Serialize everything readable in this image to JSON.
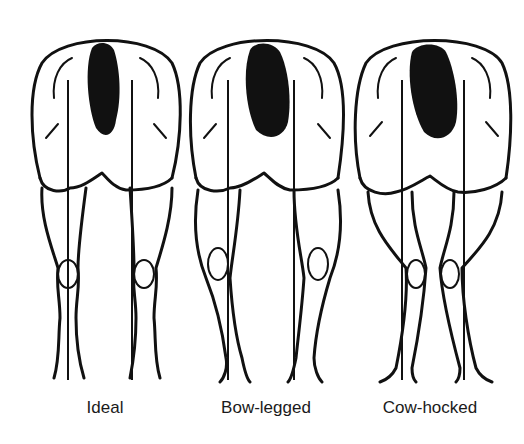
{
  "diagram": {
    "type": "hind-leg-conformation-comparison",
    "panels": [
      {
        "id": "ideal",
        "label": "Ideal",
        "center_x": 105
      },
      {
        "id": "bow-legged",
        "label": "Bow-legged",
        "center_x": 266
      },
      {
        "id": "cow-hocked",
        "label": "Cow-hocked",
        "center_x": 430
      }
    ],
    "colors": {
      "ink": "#111111",
      "background": "#ffffff"
    }
  }
}
